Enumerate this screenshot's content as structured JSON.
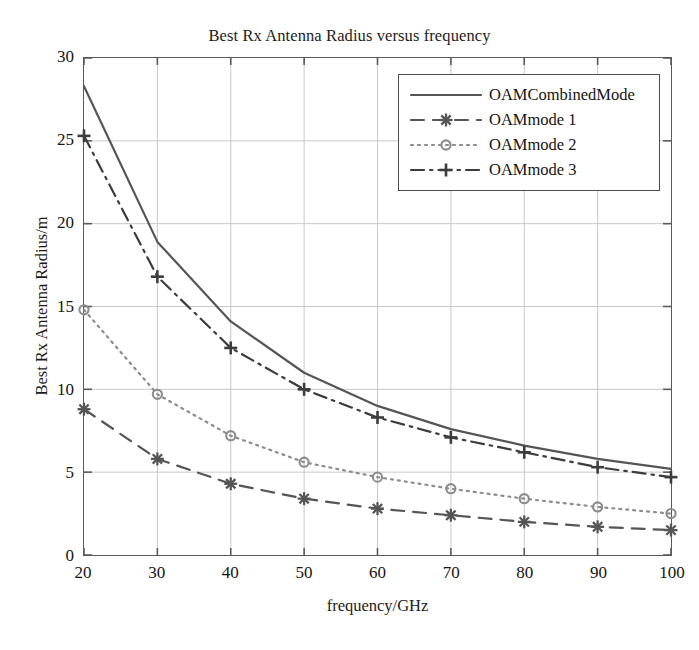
{
  "chart_data": {
    "type": "line",
    "title": "Best Rx Antenna Radius versus frequency",
    "xlabel": "frequency/GHz",
    "ylabel": "Best Rx Antenna Radius/m",
    "x": [
      20,
      30,
      40,
      50,
      60,
      70,
      80,
      90,
      100
    ],
    "xlim": [
      20,
      100
    ],
    "ylim": [
      0,
      30
    ],
    "xticks": [
      20,
      30,
      40,
      50,
      60,
      70,
      80,
      90,
      100
    ],
    "yticks": [
      0,
      5,
      10,
      15,
      20,
      25,
      30
    ],
    "xtick_labels": [
      "20",
      "30",
      "40",
      "50",
      "60",
      "70",
      "80",
      "90",
      "100"
    ],
    "ytick_labels": [
      "0",
      "5",
      "10",
      "15",
      "20",
      "25",
      "30"
    ],
    "grid": true,
    "legend_position": "upper right",
    "series": [
      {
        "name": "OAMCombinedMode",
        "values": [
          28.3,
          18.9,
          14.1,
          11.0,
          9.0,
          7.6,
          6.6,
          5.8,
          5.2
        ],
        "line_style": "solid",
        "marker": "none",
        "color": "#555555"
      },
      {
        "name": "OAMmode 1",
        "values": [
          8.8,
          5.8,
          4.3,
          3.4,
          2.8,
          2.4,
          2.0,
          1.7,
          1.5
        ],
        "line_style": "dashed",
        "marker": "asterisk",
        "color": "#555555"
      },
      {
        "name": "OAMmode 2",
        "values": [
          14.8,
          9.7,
          7.2,
          5.6,
          4.7,
          4.0,
          3.4,
          2.9,
          2.5
        ],
        "line_style": "dotted",
        "marker": "circle",
        "color": "#8c8c8c"
      },
      {
        "name": "OAMmode 3",
        "values": [
          25.3,
          16.8,
          12.5,
          10.0,
          8.3,
          7.1,
          6.2,
          5.3,
          4.7
        ],
        "line_style": "dashdot",
        "marker": "plus",
        "color": "#3c3c3c"
      }
    ]
  },
  "style": {
    "axis_color": "#5a5a5a",
    "grid_color": "#c9c9c9",
    "text_color": "#1c1c1c",
    "background": "#ffffff"
  }
}
